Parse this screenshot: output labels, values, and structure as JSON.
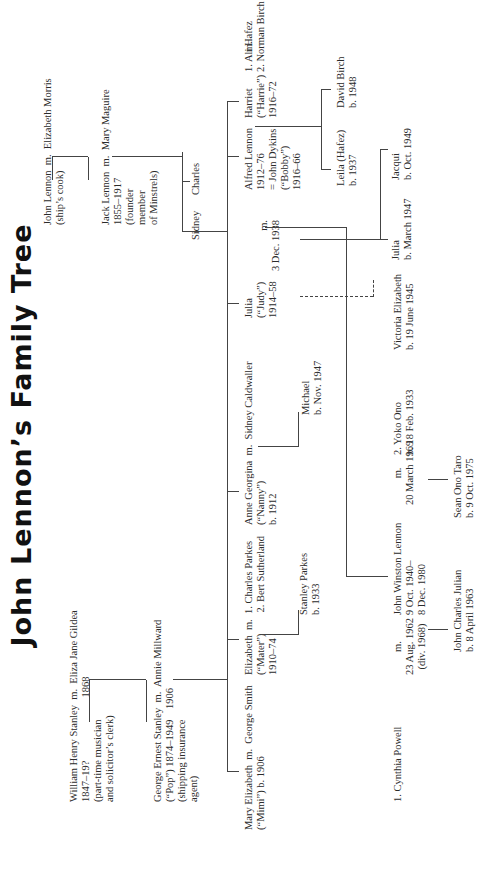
{
  "title": "John Lennon’s Family Tree",
  "people": {
    "william": [
      "William Henry Stanley  m.  Eliza Jane Gildea",
      "1847–19?                        1868",
      "(part-time musician",
      "and solicitor’s clerk)"
    ],
    "george_ernest": [
      "George Ernest Stanley  m.  Annie Millward",
      "(“Pop”) 1874–1949    1906",
      "(shipping insurance",
      "agent)"
    ],
    "mary": [
      "Mary Elizabeth  m.  George Smith",
      "(“Mimi”) b. 1906"
    ],
    "elizabeth": [
      "Elizabeth  m.  1. Charles Parkes",
      "(“Mater”)        2. Bert Sutherland",
      "1910–74"
    ],
    "stanley": [
      "Stanley Parkes",
      "b. 1933"
    ],
    "anne": [
      "Anne Georgina  m.  Sidney Caldwaller",
      "(“Nanny”)",
      "b. 1912"
    ],
    "michael": [
      "Michael",
      "b. Nov. 1947"
    ],
    "julia_judy": [
      "Julia",
      "(“Judy”)",
      "1914–58"
    ],
    "julia_marriage": [
      "m.",
      "3 Dec. 1938"
    ],
    "alfred": [
      "Alfred Lennon",
      "1912–76",
      "= John Dykins",
      "(“Bobby”)",
      "1916–66"
    ],
    "harriet": [
      "Harriet",
      "(“Harrie”)",
      "1916–72"
    ],
    "harriet_marriage": [
      "m.",
      ""
    ],
    "harriet_spouses": [
      "1. Ali Hafez",
      "2. Norman Birch"
    ],
    "leila": [
      "Leila (Hafez)",
      "b. 1937"
    ],
    "david": [
      "David Birch",
      "b. 1948"
    ],
    "julia_b1947": [
      "Julia",
      "b. March 1947"
    ],
    "jacqui": [
      "Jacqui",
      "b. Oct. 1949"
    ],
    "victoria": [
      "Victoria Elizabeth",
      "b. 19 June 1945"
    ],
    "john_lennon_sr": [
      "John Lennon  m.  Elizabeth Morris",
      "(ship’s cook)"
    ],
    "jack": [
      "Jack Lennon  m.  Mary Maguire",
      "1855–1917",
      "(founder",
      "member",
      "of Minstrels)"
    ],
    "charles": [
      "Charles"
    ],
    "sidney": [
      "Sidney"
    ],
    "cynthia": [
      "1. Cynthia Powell"
    ],
    "cynthia_marriage": [
      "m.",
      "23 Aug. 1962",
      "(div. 1968)"
    ],
    "john_winston": [
      "John Winston Lennon",
      "9 Oct. 1940–",
      "8 Dec. 1980"
    ],
    "yoko_marriage": [
      "m.",
      "20 March 1969"
    ],
    "yoko": [
      "2. Yoko Ono",
      "b. 18 Feb. 1933"
    ],
    "julian": [
      "John Charles Julian",
      "b. 8 April 1963"
    ],
    "sean": [
      "Sean Ono Taro",
      "b. 9 Oct. 1975"
    ]
  },
  "colors": {
    "line": "#444444",
    "text": "#2b2b2b",
    "title": "#111111",
    "background": "#ffffff"
  }
}
